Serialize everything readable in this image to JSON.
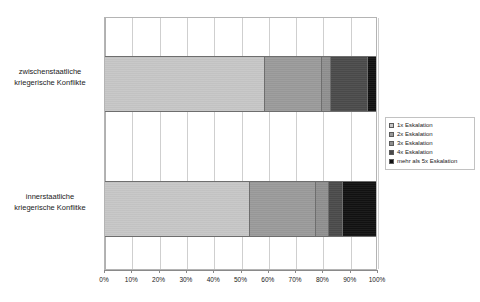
{
  "chart_data": {
    "type": "bar",
    "orientation": "horizontal",
    "stacked": true,
    "normalized_percent": true,
    "title": "",
    "xlabel": "",
    "ylabel": "",
    "xlim": [
      0,
      100
    ],
    "grid": true,
    "legend_position": "right",
    "categories": [
      "zwischenstaatliche kriegerische Konflikte",
      "innerstaatliche kriegerische Konflitke"
    ],
    "series": [
      {
        "name": "1x Eskalation",
        "color": "#c6c6c6",
        "values": [
          59,
          53.5
        ]
      },
      {
        "name": "2x Eskalation",
        "color": "#9a9a9a",
        "values": [
          21,
          24.5
        ]
      },
      {
        "name": "3x Eskalation",
        "color": "#8f8f8f",
        "values": [
          3.5,
          4.5
        ]
      },
      {
        "name": "4x Eskalation",
        "color": "#4a4a4a",
        "values": [
          13.5,
          5.5
        ]
      },
      {
        "name": "mehr als 5x Eskalation",
        "color": "#111111",
        "values": [
          3,
          12
        ]
      }
    ],
    "x_tick_labels": [
      "0%",
      "10%",
      "20%",
      "30%",
      "40%",
      "50%",
      "60%",
      "70%",
      "80%",
      "90%",
      "100%"
    ],
    "x_tick_values": [
      0,
      10,
      20,
      30,
      40,
      50,
      60,
      70,
      80,
      90,
      100
    ]
  },
  "axis": {
    "category_labels": [
      {
        "line1": "zwischenstaatliche",
        "line2": "kriegerische Konflikte"
      },
      {
        "line1": "innerstaatliche",
        "line2": "kriegerische Konflitke"
      }
    ]
  },
  "legend": {
    "items": [
      {
        "label": "1x Eskalation"
      },
      {
        "label": "2x Eskalation"
      },
      {
        "label": "3x Eskalation"
      },
      {
        "label": "4x Eskalation"
      },
      {
        "label": "mehr als 5x Eskalation"
      }
    ]
  },
  "colors": {
    "series_1": "#c6c6c6",
    "series_2": "#9a9a9a",
    "series_3": "#8f8f8f",
    "series_4": "#4a4a4a",
    "series_5": "#111111",
    "gridline": "#cfcfcf",
    "frame": "#b4b4b4",
    "background": "#ffffff"
  }
}
